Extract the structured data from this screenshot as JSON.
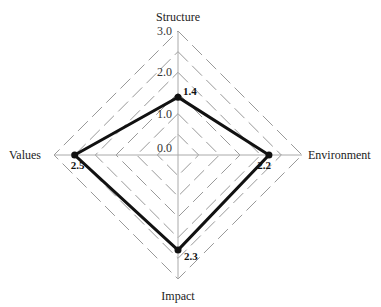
{
  "chart_data": {
    "type": "radar",
    "title": "",
    "axes": [
      "Structure",
      "Environment",
      "Impact",
      "Values"
    ],
    "values": [
      1.4,
      2.2,
      2.3,
      2.5
    ],
    "value_labels": [
      "1.4",
      "2.2",
      "2.3",
      "2.5"
    ],
    "rlim": [
      0,
      3.0
    ],
    "ticks": [
      0.0,
      1.0,
      2.0,
      3.0
    ],
    "tick_labels": [
      "0.0",
      "1.0",
      "2.0",
      "3.0"
    ],
    "grid": "dashed diamonds",
    "colors": {
      "series": "#111111",
      "grid": "#999999",
      "axis": "#aaaaaa"
    }
  }
}
